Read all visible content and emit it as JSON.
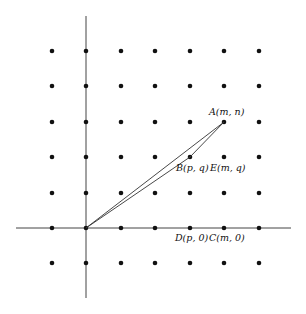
{
  "diagram": {
    "type": "lattice-points-triangle",
    "grid": {
      "columns_x": [
        52,
        86,
        121,
        155,
        190,
        224,
        259
      ],
      "rows_y": [
        51,
        86,
        122,
        157,
        193,
        228,
        263
      ],
      "origin": {
        "x": 86,
        "y": 228
      },
      "dot_color": "#111111"
    },
    "axes": {
      "x_axis": {
        "x1": 16,
        "x2": 291,
        "y": 228
      },
      "y_axis": {
        "x": 86,
        "y1": 16,
        "y2": 298
      }
    },
    "points": {
      "A": {
        "label": "A(m, n)",
        "x": 224,
        "y": 122,
        "label_x": 209,
        "label_y": 115
      },
      "B": {
        "label": "B(p, q)",
        "x": 190,
        "y": 157,
        "label_x": 176,
        "label_y": 171
      },
      "E": {
        "label": "E(m, q)",
        "x": 224,
        "y": 157,
        "label_x": 210,
        "label_y": 171
      },
      "D": {
        "label": "D(p, 0)",
        "x": 190,
        "y": 228,
        "label_x": 175,
        "label_y": 241
      },
      "C": {
        "label": "C(m, 0)",
        "x": 224,
        "y": 228,
        "label_x": 209,
        "label_y": 241
      }
    },
    "segments": [
      {
        "from": "O",
        "to": "A"
      },
      {
        "from": "O",
        "to": "B"
      },
      {
        "from": "B",
        "to": "A"
      }
    ]
  }
}
